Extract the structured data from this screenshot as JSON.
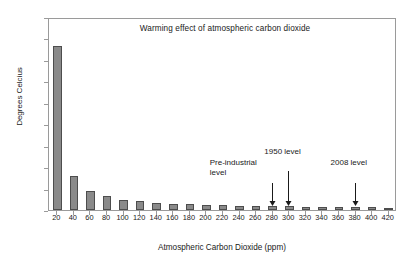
{
  "chart_data": {
    "type": "bar",
    "title": "Warming effect of atmospheric carbon dioxide",
    "xlabel": "Atmospheric Carbon Dioxide (ppm)",
    "ylabel": "Degrees Celcius",
    "xlim": [
      10,
      430
    ],
    "ylim": [
      0.0,
      1.8
    ],
    "grid": false,
    "legend": null,
    "categories": [
      20,
      40,
      60,
      80,
      100,
      120,
      140,
      160,
      180,
      200,
      220,
      240,
      260,
      280,
      300,
      320,
      340,
      360,
      380,
      400,
      420
    ],
    "values": [
      1.53,
      0.32,
      0.18,
      0.13,
      0.09,
      0.08,
      0.07,
      0.06,
      0.055,
      0.05,
      0.045,
      0.04,
      0.04,
      0.035,
      0.035,
      0.03,
      0.03,
      0.03,
      0.025,
      0.025,
      0.02
    ],
    "ytick_labels": [
      "0.0",
      "0.2",
      "0.4",
      "0.6",
      "0.8",
      "1.0",
      "1.2",
      "1.4",
      "1.6",
      "1.8"
    ],
    "ytick_values": [
      0.0,
      0.2,
      0.4,
      0.6,
      0.8,
      1.0,
      1.2,
      1.4,
      1.6,
      1.8
    ],
    "xtick_labels": [
      "20",
      "40",
      "60",
      "80",
      "100",
      "120",
      "140",
      "160",
      "180",
      "200",
      "220",
      "240",
      "260",
      "280",
      "300",
      "320",
      "340",
      "360",
      "380",
      "400",
      "420"
    ],
    "annotations": [
      {
        "text": "Pre-industrial\nlevel",
        "target_x": 280,
        "label_offset_x": -62,
        "label_offset_y": -47,
        "arrow_top_offset": -22
      },
      {
        "text": "1950 level",
        "target_x": 300,
        "label_offset_x": -24,
        "label_offset_y": -58,
        "arrow_top_offset": -34
      },
      {
        "text": "2008 level",
        "target_x": 380,
        "label_offset_x": -24,
        "label_offset_y": -47,
        "arrow_top_offset": -22
      }
    ],
    "bar_color": "#8a8a8a",
    "bar_edge_color": "#4d4d4d",
    "frame_color": "#9a9a9a",
    "background": "#ffffff"
  }
}
